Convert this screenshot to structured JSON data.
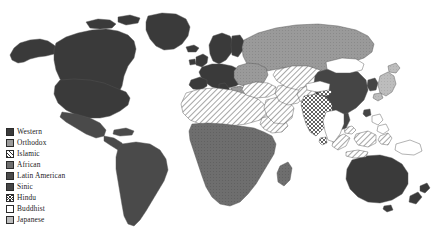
{
  "figure": {
    "background_color": "#ffffff",
    "width": 440,
    "height": 237
  },
  "legend": {
    "position": "bottom-left",
    "items": [
      {
        "label": "Western",
        "pattern": "solid-dark",
        "color": "#3a3a3a"
      },
      {
        "label": "Orthodox",
        "pattern": "solid-medium",
        "color": "#9a9a9a"
      },
      {
        "label": "Islamic",
        "pattern": "diagonal-hatch",
        "color": "#2f2f2f"
      },
      {
        "label": "African",
        "pattern": "solid-gray",
        "color": "#6e6e6e"
      },
      {
        "label": "Latin American",
        "pattern": "solid-darkgray",
        "color": "#4a4a4a"
      },
      {
        "label": "Sinic",
        "pattern": "solid-dark",
        "color": "#454545"
      },
      {
        "label": "Hindu",
        "pattern": "cross-hatch",
        "color": "#2f2f2f"
      },
      {
        "label": "Buddhist",
        "pattern": "empty-white",
        "color": "#ffffff"
      },
      {
        "label": "Japanese",
        "pattern": "solid-light",
        "color": "#bdbdbd"
      }
    ]
  },
  "map": {
    "outline_color": "#555555",
    "regions": [
      {
        "name": "North America",
        "civilization": "Western"
      },
      {
        "name": "Greenland",
        "civilization": "Western"
      },
      {
        "name": "Western Europe",
        "civilization": "Western"
      },
      {
        "name": "Australia",
        "civilization": "Western"
      },
      {
        "name": "New Zealand",
        "civilization": "Western"
      },
      {
        "name": "Russia",
        "civilization": "Orthodox"
      },
      {
        "name": "Eastern Europe",
        "civilization": "Orthodox"
      },
      {
        "name": "North Africa",
        "civilization": "Islamic"
      },
      {
        "name": "Middle East",
        "civilization": "Islamic"
      },
      {
        "name": "Central Asia",
        "civilization": "Islamic"
      },
      {
        "name": "Indonesia",
        "civilization": "Islamic"
      },
      {
        "name": "Sub-Saharan Africa",
        "civilization": "African"
      },
      {
        "name": "South America",
        "civilization": "Latin American"
      },
      {
        "name": "Mexico and Central America",
        "civilization": "Latin American"
      },
      {
        "name": "China",
        "civilization": "Sinic"
      },
      {
        "name": "Korea",
        "civilization": "Sinic"
      },
      {
        "name": "Vietnam",
        "civilization": "Sinic"
      },
      {
        "name": "India",
        "civilization": "Hindu"
      },
      {
        "name": "Mainland Southeast Asia",
        "civilization": "Buddhist"
      },
      {
        "name": "Mongolia",
        "civilization": "Buddhist"
      },
      {
        "name": "Japan",
        "civilization": "Japanese"
      }
    ]
  }
}
